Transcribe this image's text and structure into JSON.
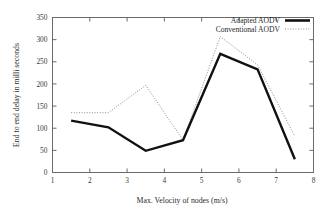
{
  "chart_data": {
    "type": "line",
    "title": "",
    "subtitle": "",
    "xlabel": "Max. Velocity of nodes (m/s)",
    "ylabel": "End to end delay in milli seconds",
    "xlim": [
      1,
      8
    ],
    "ylim": [
      0,
      350
    ],
    "xticks": [
      1,
      2,
      3,
      4,
      5,
      6,
      7,
      8
    ],
    "yticks": [
      0,
      50,
      100,
      150,
      200,
      250,
      300,
      350
    ],
    "xticklabels": [
      "1",
      "2",
      "3",
      "4",
      "5",
      "6",
      "7",
      "8"
    ],
    "yticklabels": [
      "0",
      "50",
      "100",
      "150",
      "200",
      "250",
      "300",
      "350"
    ],
    "grid": false,
    "legend_position": "top-right-inside",
    "x": [
      1.5,
      2.5,
      3.5,
      4.5,
      5.5,
      6.5,
      7.5
    ],
    "series": [
      {
        "name": "Adapted AODV",
        "style": "solid",
        "color": "#111111",
        "values": [
          117,
          102,
          49,
          73,
          268,
          233,
          30
        ]
      },
      {
        "name": "Conventional AODV",
        "style": "dotted",
        "color": "#8d8d8d",
        "values": [
          135,
          135,
          197,
          73,
          307,
          243,
          82
        ]
      }
    ],
    "annotations": []
  },
  "legend": {
    "entries": [
      {
        "label": "Adapted AODV"
      },
      {
        "label": "Conventional AODV"
      }
    ]
  }
}
